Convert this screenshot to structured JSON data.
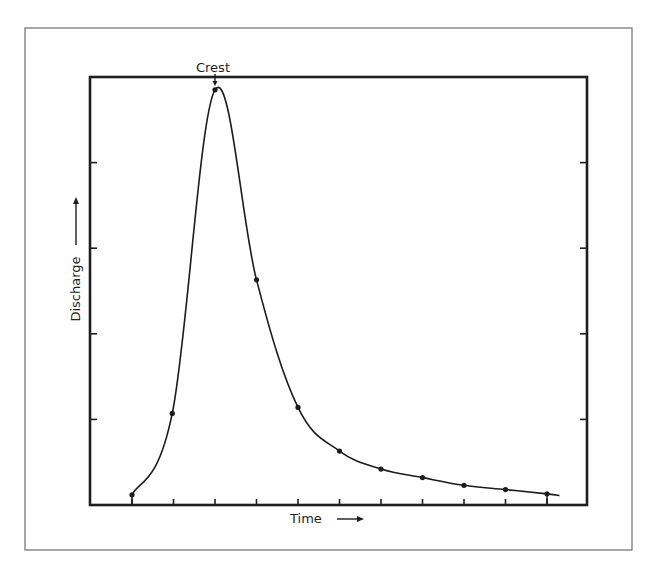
{
  "chart_data": {
    "type": "line",
    "title": "",
    "xlabel": "Time",
    "ylabel": "Discharge",
    "x_arrow": true,
    "y_arrow": true,
    "annotation": {
      "text": "Crest",
      "x": 2,
      "y": 4.85
    },
    "x_ticks": [
      0,
      1,
      2,
      3,
      4,
      5,
      6,
      7,
      8,
      9,
      10
    ],
    "y_ticks": [
      1,
      2,
      3,
      4
    ],
    "tick_labels_shown": false,
    "xlim": [
      -0.97,
      11.0
    ],
    "ylim": [
      0,
      5.0
    ],
    "grid": false,
    "legend": null,
    "series": [
      {
        "name": "Hydrograph",
        "x": [
          0,
          0.97,
          2.0,
          3.0,
          4.0,
          5.0,
          6.0,
          7.0,
          8.0,
          9.0,
          10.0
        ],
        "values": [
          0.12,
          1.07,
          4.85,
          2.63,
          1.14,
          0.63,
          0.42,
          0.32,
          0.23,
          0.18,
          0.13
        ]
      }
    ],
    "curve_end": {
      "x": 10.3,
      "y": 0.11
    }
  },
  "layout": {
    "outer": {
      "x": 25,
      "y": 28,
      "w": 607,
      "h": 522
    },
    "plot": {
      "x": 90,
      "y": 77,
      "w": 497,
      "h": 428
    },
    "x0_px": 132,
    "x_step_px": 41.5,
    "y_unit_px": 85.6
  },
  "colors": {
    "ink": "#1e1e1e",
    "frame": "#6e6e6e",
    "background": "#ffffff"
  }
}
